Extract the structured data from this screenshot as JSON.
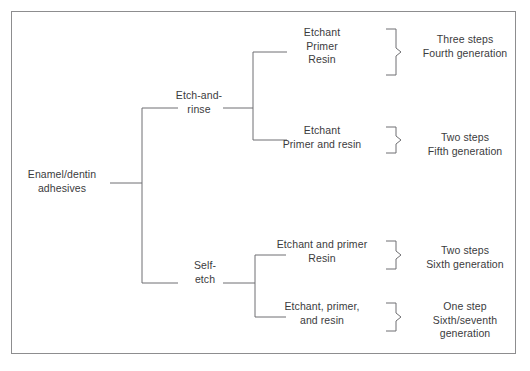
{
  "diagram": {
    "title_text": "Enamel/dentin adhesives classification tree",
    "frame_color": "#8d8d8f",
    "line_color": "#6f6f72",
    "text_color": "#3b3b3d",
    "background": "#ffffff",
    "root": {
      "label": "Enamel/dentin\nadhesives"
    },
    "branches": [
      {
        "id": "etch-and-rinse",
        "label": "Etch-and-\nrinse"
      },
      {
        "id": "self-etch",
        "label": "Self-\netch"
      }
    ],
    "leaves": [
      {
        "id": "etchant-primer-resin",
        "components": "Etchant\nPrimer\nResin",
        "outcome": "Three steps\nFourth generation"
      },
      {
        "id": "etchant-primer-and-resin",
        "components": "Etchant\nPrimer and resin",
        "outcome": "Two steps\nFifth generation"
      },
      {
        "id": "etchant-and-primer-resin",
        "components": "Etchant and primer\nResin",
        "outcome": "Two steps\nSixth generation"
      },
      {
        "id": "etchant-primer-and-resin-all",
        "components": "Etchant, primer,\nand resin",
        "outcome": "One step\nSixth/seventh\ngeneration"
      }
    ]
  }
}
